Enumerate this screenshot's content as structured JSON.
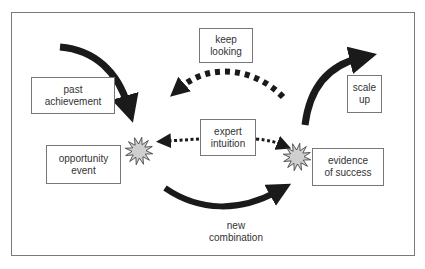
{
  "diagram": {
    "nodes": {
      "keep_looking": "keep\nlooking",
      "past_achievement": "past\nachievement",
      "scale_up": "scale\nup",
      "expert_intuition": "expert\nintuition",
      "opportunity_event": "opportunity\nevent",
      "evidence_of_success": "evidence\nof success",
      "new_combination": "new\ncombination"
    },
    "edges": [
      {
        "from": "past_achievement",
        "to": "opportunity_event",
        "style": "solid"
      },
      {
        "from": "evidence_of_success",
        "to": "opportunity_event",
        "label": "keep_looking",
        "style": "dotted"
      },
      {
        "from": "evidence_of_success",
        "to": "scale_up",
        "style": "solid"
      },
      {
        "from": "expert_intuition",
        "to": "opportunity_event",
        "style": "dotted"
      },
      {
        "from": "expert_intuition",
        "to": "evidence_of_success",
        "style": "dotted"
      },
      {
        "from": "opportunity_event",
        "to": "evidence_of_success",
        "label": "new_combination",
        "style": "solid"
      }
    ],
    "colors": {
      "arrow": "#1a1a1a",
      "burst_fill": "#cfcfcf",
      "box_border": "#777777",
      "text": "#333333"
    }
  }
}
